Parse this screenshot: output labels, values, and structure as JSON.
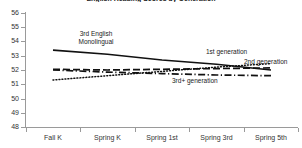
{
  "chart_data": {
    "type": "line",
    "title": "English Reading Scores by Generation",
    "xlabel": "",
    "ylabel": "",
    "categories": [
      "Fall K",
      "Spring K",
      "Spring 1st",
      "Spring 3rd",
      "Spring 5th"
    ],
    "ylim": [
      48,
      56
    ],
    "yticks": [
      48,
      49,
      50,
      51,
      52,
      53,
      54,
      55,
      56
    ],
    "grid": false,
    "legend_position": "inline-annotations",
    "series": [
      {
        "name": "3rd English Monolingual",
        "style": "solid",
        "color": "#111111",
        "values": [
          53.4,
          53.1,
          52.7,
          52.4,
          52.0
        ]
      },
      {
        "name": "1st generation",
        "style": "dotted",
        "color": "#111111",
        "values": [
          51.3,
          51.6,
          51.9,
          52.2,
          52.45
        ]
      },
      {
        "name": "2nd generation",
        "style": "dashed",
        "color": "#111111",
        "values": [
          52.05,
          52.0,
          52.05,
          52.1,
          52.15
        ]
      },
      {
        "name": "3rd+ generation",
        "style": "dash-dot",
        "color": "#111111",
        "values": [
          52.0,
          51.85,
          51.75,
          51.65,
          51.6
        ]
      }
    ],
    "annotations": [
      {
        "name": "3rd-english-monolingual-label",
        "line1": "3rd English",
        "line2": "Monolingual"
      },
      {
        "name": "first-generation-label",
        "text": "1st generation"
      },
      {
        "name": "second-generation-label",
        "text": "2nd generation"
      },
      {
        "name": "third-plus-generation-label",
        "text": "3rd+ generation"
      }
    ]
  }
}
